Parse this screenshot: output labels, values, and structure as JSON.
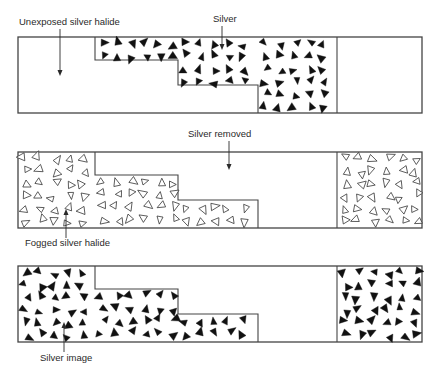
{
  "colors": {
    "line": "#444444",
    "silver": "#111111",
    "text": "#2a2a2a",
    "background": "#ffffff"
  },
  "labels": {
    "unexposed": "Unexposed silver halide",
    "silver": "Silver",
    "silver_removed": "Silver removed",
    "fogged": "Fogged silver halide",
    "silver_image": "Silver image"
  },
  "strips": [
    {
      "id": "strip-1-development",
      "y": 37,
      "height": 76,
      "left_fill": "none",
      "step_fill": "silver",
      "right_fill": "none"
    },
    {
      "id": "strip-2-bleach-fog",
      "y": 152,
      "height": 76,
      "left_fill": "fogged-halide",
      "step_fill": "none",
      "right_fill": "fogged-halide"
    },
    {
      "id": "strip-3-second-development",
      "y": 266,
      "height": 76,
      "left_fill": "silver",
      "step_fill": "none",
      "right_fill": "silver"
    }
  ],
  "geometry": {
    "x_left": 18,
    "x_right": 422,
    "x_divider": 337,
    "step_x": [
      95,
      178,
      258
    ],
    "step_y_offsets": [
      0,
      23,
      48,
      76
    ]
  }
}
